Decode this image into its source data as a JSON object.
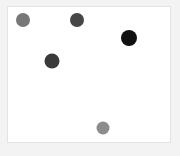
{
  "figure": {
    "background_color": "#f3f3f3",
    "panel_background_color": "#ffffff",
    "panel_border_color": "#e3e3e3",
    "width": 180,
    "height": 156,
    "title": "",
    "xlabel": "",
    "ylabel": ""
  },
  "chart_data": {
    "type": "scatter",
    "title": "",
    "xlabel": "",
    "ylabel": "",
    "grid": false,
    "legend": null,
    "axis_ticks_visible": false,
    "axis_labels_visible": false,
    "xlim": [
      0,
      164
    ],
    "ylim": [
      0,
      137
    ],
    "colormap": "grayscale",
    "series": [
      {
        "name": "points",
        "marker": "circle",
        "points": [
          {
            "id": "point-1",
            "x": 15,
            "y": 124,
            "px_x": 15,
            "px_y": 13,
            "radius": 7.0,
            "color": "#777777",
            "value": 0.47
          },
          {
            "id": "point-2",
            "x": 69,
            "y": 124,
            "px_x": 69,
            "px_y": 13,
            "radius": 7.0,
            "color": "#464646",
            "value": 0.27
          },
          {
            "id": "point-3",
            "x": 121,
            "y": 106,
            "px_x": 121,
            "px_y": 31,
            "radius": 8.0,
            "color": "#111111",
            "value": 0.07
          },
          {
            "id": "point-4",
            "x": 44,
            "y": 83,
            "px_x": 44,
            "px_y": 54,
            "radius": 7.5,
            "color": "#3a3a3a",
            "value": 0.23
          },
          {
            "id": "point-5",
            "x": 95,
            "y": 16,
            "px_x": 95,
            "px_y": 121,
            "radius": 6.5,
            "color": "#8c8c8c",
            "value": 0.55
          }
        ]
      }
    ]
  }
}
